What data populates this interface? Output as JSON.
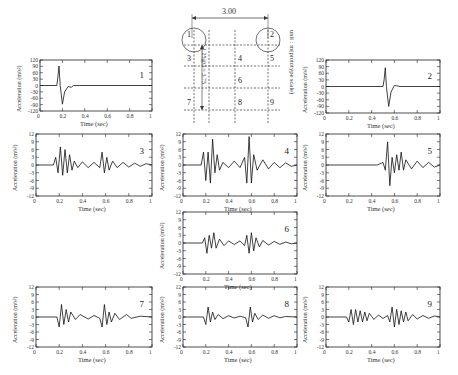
{
  "figure": {
    "diagram": {
      "dimension_top": "3.00",
      "dimension_vertical": "1.25@3 = 3.75",
      "unit_label": "unit : m(prototype scale)",
      "nodes": [
        "1",
        "2",
        "3",
        "4",
        "5",
        "6",
        "7",
        "8",
        "9"
      ]
    },
    "caption": ""
  },
  "chart_data": [
    {
      "type": "line",
      "panel": "1",
      "title": "1",
      "xlabel": "Time (sec)",
      "ylabel": "Acceleration (m/s²)",
      "xlim": [
        0,
        1
      ],
      "ylim": [
        -120,
        120
      ],
      "xticks": [
        "0",
        "0.2",
        "0.4",
        "0.6",
        "0.8",
        "1"
      ],
      "yticks": [
        "120",
        "90",
        "60",
        "30",
        "0",
        "-30",
        "-60",
        "-90",
        "-120"
      ],
      "series": [
        {
          "name": "1",
          "x": [
            0,
            0.15,
            0.16,
            0.17,
            0.18,
            0.2,
            0.22,
            0.25,
            0.28,
            0.3,
            0.35,
            1.0
          ],
          "values": [
            0,
            0,
            40,
            92,
            0,
            -88,
            -30,
            -5,
            -8,
            0,
            0,
            0
          ]
        }
      ]
    },
    {
      "type": "line",
      "panel": "2",
      "title": "2",
      "xlabel": "Time (sec)",
      "ylabel": "Acceleration (m/s²)",
      "xlim": [
        0,
        1
      ],
      "ylim": [
        -120,
        120
      ],
      "xticks": [
        "0",
        "0.2",
        "0.4",
        "0.6",
        "0.8",
        "1"
      ],
      "yticks": [
        "120",
        "90",
        "60",
        "30",
        "0",
        "-30",
        "-60",
        "-90",
        "-120"
      ],
      "series": [
        {
          "name": "2",
          "x": [
            0,
            0.5,
            0.51,
            0.52,
            0.53,
            0.55,
            0.57,
            0.6,
            0.62,
            0.65,
            0.7,
            1.0
          ],
          "values": [
            0,
            0,
            30,
            85,
            0,
            -90,
            -25,
            5,
            3,
            0,
            0,
            0
          ]
        }
      ]
    },
    {
      "type": "line",
      "panel": "3",
      "title": "3",
      "xlabel": "Time (sec)",
      "ylabel": "Acceleration (m/s²)",
      "xlim": [
        0,
        1
      ],
      "ylim": [
        -12,
        12
      ],
      "xticks": [
        "0",
        "0.2",
        "0.4",
        "0.6",
        "0.8",
        "1"
      ],
      "yticks": [
        "12",
        "9",
        "6",
        "3",
        "0",
        "-3",
        "-6",
        "-9",
        "-12"
      ],
      "series": [
        {
          "name": "3",
          "x": [
            0,
            0.15,
            0.17,
            0.19,
            0.21,
            0.23,
            0.25,
            0.27,
            0.29,
            0.31,
            0.33,
            0.36,
            0.4,
            0.45,
            0.5,
            0.55,
            0.57,
            0.59,
            0.61,
            0.63,
            0.66,
            0.7,
            0.75,
            0.8,
            0.85,
            0.9,
            0.95,
            1.0
          ],
          "values": [
            0,
            0,
            3,
            -3,
            7,
            -4,
            6,
            -3,
            4,
            -2,
            1.5,
            -1,
            1.2,
            -1,
            1,
            -1,
            5,
            -3,
            3,
            -2,
            1.5,
            -1,
            1,
            -0.8,
            0.7,
            -0.5,
            0.5,
            0
          ]
        }
      ]
    },
    {
      "type": "line",
      "panel": "4",
      "title": "4",
      "xlabel": "Time (sec)",
      "ylabel": "Acceleration (m/s²)",
      "xlim": [
        0,
        1
      ],
      "ylim": [
        -12,
        12
      ],
      "xticks": [
        "0",
        "0.2",
        "0.4",
        "0.6",
        "0.8",
        "1"
      ],
      "yticks": [
        "12",
        "9",
        "6",
        "3",
        "0",
        "-3",
        "-6",
        "-9",
        "-12"
      ],
      "series": [
        {
          "name": "4",
          "x": [
            0,
            0.16,
            0.18,
            0.2,
            0.22,
            0.24,
            0.26,
            0.28,
            0.3,
            0.32,
            0.35,
            0.4,
            0.45,
            0.5,
            0.54,
            0.56,
            0.58,
            0.6,
            0.62,
            0.65,
            0.7,
            0.75,
            0.8,
            0.85,
            0.9,
            0.95,
            1.0
          ],
          "values": [
            0,
            0,
            5,
            -6,
            5,
            -7,
            10,
            -3,
            4,
            -2,
            1,
            -1,
            1.5,
            -1,
            3,
            -7,
            11,
            -7,
            4,
            -2,
            2,
            -1.5,
            1,
            -1,
            0.8,
            -0.5,
            0
          ]
        }
      ]
    },
    {
      "type": "line",
      "panel": "5",
      "title": "5",
      "xlabel": "Time (sec)",
      "ylabel": "Acceleration (m/s²)",
      "xlim": [
        0,
        1
      ],
      "ylim": [
        -12,
        12
      ],
      "xticks": [
        "0",
        "0.2",
        "0.4",
        "0.6",
        "0.8",
        "1"
      ],
      "yticks": [
        "12",
        "9",
        "6",
        "3",
        "0",
        "-3",
        "-6",
        "-9",
        "-12"
      ],
      "series": [
        {
          "name": "5",
          "x": [
            0,
            0.45,
            0.5,
            0.52,
            0.54,
            0.56,
            0.58,
            0.6,
            0.62,
            0.64,
            0.66,
            0.68,
            0.7,
            0.75,
            0.8,
            0.85,
            0.9,
            0.95,
            1.0
          ],
          "values": [
            0,
            0,
            1,
            -2,
            9,
            -8,
            3,
            -3,
            4,
            -2,
            5,
            -2,
            2,
            -1.5,
            1.5,
            -1,
            1,
            -0.8,
            0
          ]
        }
      ]
    },
    {
      "type": "line",
      "panel": "6",
      "title": "6",
      "xlabel": "Time (sec)",
      "ylabel": "Acceleration (m/s²)",
      "xlim": [
        0,
        1
      ],
      "ylim": [
        -12,
        12
      ],
      "xticks": [
        "0",
        "0.2",
        "0.4",
        "0.6",
        "0.8",
        "1"
      ],
      "yticks": [
        "12",
        "9",
        "6",
        "3",
        "0",
        "-3",
        "-6",
        "-9",
        "-12"
      ],
      "series": [
        {
          "name": "6",
          "x": [
            0,
            0.17,
            0.19,
            0.21,
            0.23,
            0.25,
            0.27,
            0.29,
            0.32,
            0.36,
            0.4,
            0.45,
            0.5,
            0.54,
            0.56,
            0.58,
            0.6,
            0.62,
            0.64,
            0.67,
            0.7,
            0.75,
            0.8,
            0.85,
            0.9,
            0.95,
            1.0
          ],
          "values": [
            0,
            0,
            2,
            -4,
            3,
            -2,
            4,
            -2,
            1.5,
            -1,
            0.8,
            -0.6,
            0.8,
            -1,
            3,
            -4,
            4,
            -3,
            2,
            -1.5,
            1,
            -0.8,
            0.6,
            -0.5,
            0.4,
            -0.3,
            0
          ]
        }
      ]
    },
    {
      "type": "line",
      "panel": "7",
      "title": "7",
      "xlabel": "Time (sec)",
      "ylabel": "Acceleration (m/s²)",
      "xlim": [
        0,
        1
      ],
      "ylim": [
        -12,
        12
      ],
      "xticks": [
        "0",
        "0.2",
        "0.4",
        "0.6",
        "0.8",
        "1"
      ],
      "yticks": [
        "12",
        "9",
        "6",
        "3",
        "0",
        "-3",
        "-6",
        "-9",
        "-12"
      ],
      "series": [
        {
          "name": "7",
          "x": [
            0,
            0.18,
            0.2,
            0.22,
            0.24,
            0.26,
            0.28,
            0.3,
            0.34,
            0.38,
            0.45,
            0.5,
            0.55,
            0.57,
            0.59,
            0.61,
            0.63,
            0.65,
            0.68,
            0.72,
            0.78,
            0.82,
            0.9,
            1.0
          ],
          "values": [
            0,
            0,
            -4,
            5,
            -3,
            3,
            -2,
            2,
            -1,
            1,
            -0.8,
            0.6,
            -0.5,
            -4,
            5,
            -3,
            2,
            -2,
            1.5,
            -1,
            1,
            -0.5,
            0.3,
            0
          ]
        }
      ]
    },
    {
      "type": "line",
      "panel": "8",
      "title": "8",
      "xlabel": "Time (sec)",
      "ylabel": "Acceleration (m/s²)",
      "xlim": [
        0,
        1
      ],
      "ylim": [
        -12,
        12
      ],
      "xticks": [
        "0",
        "0.2",
        "0.4",
        "0.6",
        "0.8",
        "1"
      ],
      "yticks": [
        "12",
        "9",
        "6",
        "3",
        "0",
        "-3",
        "-6",
        "-9",
        "-12"
      ],
      "series": [
        {
          "name": "8",
          "x": [
            0,
            0.18,
            0.2,
            0.22,
            0.24,
            0.26,
            0.28,
            0.31,
            0.35,
            0.4,
            0.45,
            0.5,
            0.55,
            0.57,
            0.59,
            0.61,
            0.63,
            0.66,
            0.7,
            0.75,
            0.8,
            0.85,
            0.9,
            1.0
          ],
          "values": [
            0,
            0,
            -3,
            4,
            -2,
            2,
            -1,
            1,
            -0.7,
            0.5,
            -0.4,
            0.3,
            -0.3,
            -4,
            4,
            -2,
            1.5,
            -1,
            0.8,
            -0.5,
            0.5,
            -0.3,
            0.2,
            0
          ]
        }
      ]
    },
    {
      "type": "line",
      "panel": "9",
      "title": "9",
      "xlabel": "Time (sec)",
      "ylabel": "Acceleration (m/s²)",
      "xlim": [
        0,
        1
      ],
      "ylim": [
        -12,
        12
      ],
      "xticks": [
        "0",
        "0.2",
        "0.4",
        "0.6",
        "0.8",
        "1"
      ],
      "yticks": [
        "12",
        "9",
        "6",
        "3",
        "0",
        "-3",
        "-6",
        "-9",
        "-12"
      ],
      "series": [
        {
          "name": "9",
          "x": [
            0,
            0.18,
            0.2,
            0.22,
            0.24,
            0.26,
            0.28,
            0.3,
            0.32,
            0.34,
            0.36,
            0.38,
            0.42,
            0.46,
            0.5,
            0.54,
            0.56,
            0.58,
            0.6,
            0.62,
            0.64,
            0.66,
            0.68,
            0.7,
            0.72,
            0.76,
            0.8,
            0.85,
            0.9,
            0.95,
            1.0
          ],
          "values": [
            0,
            0,
            -2,
            3,
            -3,
            3,
            -2,
            2.5,
            -2,
            2,
            -1.5,
            1.5,
            -1,
            0.8,
            -0.6,
            0.6,
            -2,
            4,
            -4,
            3,
            -3,
            2.5,
            -2,
            2,
            -1.5,
            1,
            -0.8,
            0.6,
            -0.5,
            0.4,
            0
          ]
        }
      ]
    }
  ]
}
